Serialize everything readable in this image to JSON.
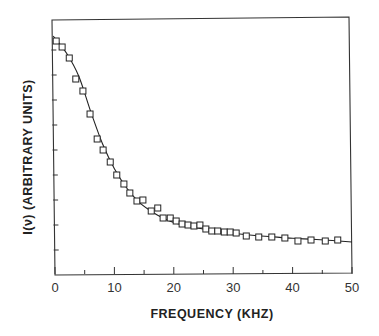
{
  "chart_data": {
    "type": "scatter",
    "title": "",
    "xlabel": "FREQUENCY (KHZ)",
    "ylabel": "I(ν)  (ARBITRARY UNITS)",
    "xlim": [
      0,
      50
    ],
    "ylim": [
      0,
      10
    ],
    "x_ticks_major": [
      0,
      10,
      20,
      30,
      40,
      50
    ],
    "x_tick_labels": [
      "0",
      "10",
      "20",
      "30",
      "40",
      "50"
    ],
    "x_ticks_minor": [
      5,
      15,
      25,
      35,
      45
    ],
    "y_ticks": [
      1,
      2,
      3,
      4,
      5,
      6,
      7,
      8,
      9
    ],
    "y_tick_labels": [],
    "grid": false,
    "legend": null,
    "series": [
      {
        "name": "measured",
        "marker": "open-square",
        "x": [
          0.2,
          1.2,
          2.4,
          3.5,
          4.7,
          5.9,
          7.1,
          8.1,
          9.3,
          10.4,
          11.6,
          12.6,
          13.8,
          14.8,
          16.2,
          17.3,
          18.2,
          19.4,
          20.4,
          21.4,
          22.4,
          23.4,
          24.4,
          25.4,
          26.4,
          27.4,
          28.5,
          29.5,
          30.5,
          32.2,
          34.3,
          36.5,
          38.7,
          40.9,
          43.1,
          45.5,
          47.6
        ],
        "y": [
          9.36,
          9.12,
          8.68,
          7.84,
          7.36,
          6.44,
          5.44,
          5.0,
          4.52,
          4.0,
          3.64,
          3.28,
          2.96,
          3.0,
          2.56,
          2.68,
          2.28,
          2.28,
          2.16,
          2.04,
          2.0,
          1.96,
          2.0,
          1.84,
          1.76,
          1.76,
          1.72,
          1.72,
          1.68,
          1.56,
          1.52,
          1.52,
          1.48,
          1.36,
          1.4,
          1.36,
          1.4
        ]
      },
      {
        "name": "fit",
        "line": "solid",
        "x": [
          -0.3,
          2,
          4,
          6,
          8,
          10,
          12,
          14,
          16,
          18,
          20,
          24,
          28,
          32,
          36,
          40,
          44,
          50
        ],
        "y": [
          9.56,
          8.85,
          7.95,
          6.55,
          5.25,
          4.25,
          3.5,
          2.95,
          2.58,
          2.3,
          2.1,
          1.88,
          1.72,
          1.62,
          1.54,
          1.47,
          1.42,
          1.32
        ]
      }
    ]
  }
}
